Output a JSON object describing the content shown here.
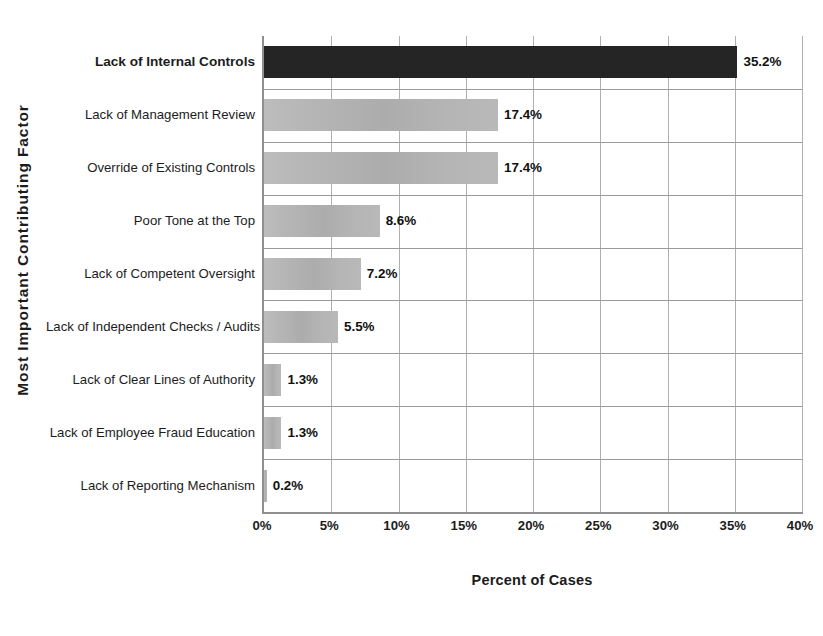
{
  "chart_data": {
    "type": "bar",
    "orientation": "horizontal",
    "title": "",
    "xlabel": "Percent of Cases",
    "ylabel": "Most Important Contributing Factor",
    "xlim": [
      0,
      40
    ],
    "xticks": [
      "0%",
      "5%",
      "10%",
      "15%",
      "20%",
      "25%",
      "30%",
      "35%",
      "40%"
    ],
    "xtick_values": [
      0,
      5,
      10,
      15,
      20,
      25,
      30,
      35,
      40
    ],
    "grid": "both",
    "legend": "none",
    "categories": [
      "Lack of Internal Controls",
      "Lack of Management Review",
      "Override of Existing Controls",
      "Poor Tone at the Top",
      "Lack of Competent Oversight",
      "Lack of Independent Checks / Audits",
      "Lack of Clear Lines of Authority",
      "Lack of Employee Fraud Education",
      "Lack of Reporting Mechanism"
    ],
    "values": [
      35.2,
      17.4,
      17.4,
      8.6,
      7.2,
      5.5,
      1.3,
      1.3,
      0.2
    ],
    "value_labels": [
      "35.2%",
      "17.4%",
      "17.4%",
      "8.6%",
      "7.2%",
      "5.5%",
      "1.3%",
      "1.3%",
      "0.2%"
    ],
    "bar_colors": [
      "#252525",
      "#b5b5b5",
      "#b5b5b5",
      "#b5b5b5",
      "#b5b5b5",
      "#b5b5b5",
      "#b5b5b5",
      "#b5b5b5",
      "#b5b5b5"
    ],
    "highlight_index": 0,
    "colors": {
      "highlight_bar": "#252525",
      "bar": "#b5b5b5",
      "axis": "#8f8f8f",
      "grid": "#aaaaaa",
      "text": "#1c1c1c",
      "background": "#ffffff"
    }
  }
}
